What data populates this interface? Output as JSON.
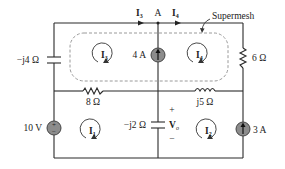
{
  "diagram": {
    "type": "circuit",
    "annotation": "Supermesh",
    "node_label": "A",
    "components": {
      "cap_left": "−j4 Ω",
      "res_top_right": "6 Ω",
      "res_middle": "8 Ω",
      "ind_middle": "j5 Ω",
      "cap_center": "−j2 Ω",
      "vsrc": "10 V",
      "isrc_top": "4 A",
      "isrc_right": "3 A"
    },
    "currents": {
      "branch_left": "I",
      "branch_left_sub": "3",
      "branch_right": "I",
      "branch_right_sub": "4"
    },
    "meshes": {
      "m1": "I",
      "m1_sub": "1",
      "m2": "I",
      "m2_sub": "2",
      "m3": "I",
      "m3_sub": "3",
      "m4": "I",
      "m4_sub": "4"
    },
    "voltage": {
      "name": "V",
      "sub": "o",
      "plus": "+",
      "minus": "−"
    },
    "vsrc_symbol": {
      "plus": "+",
      "minus": "−"
    },
    "colors": {
      "wire": "#2a2a2a",
      "source_fill": "#8c8c8c",
      "dash": "#9a9a9a"
    }
  }
}
